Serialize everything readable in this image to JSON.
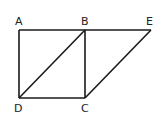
{
  "diagram": {
    "title": "",
    "points": {
      "A": {
        "label": "A",
        "x": 19,
        "y": 30
      },
      "B": {
        "label": "B",
        "x": 85,
        "y": 30
      },
      "E": {
        "label": "E",
        "x": 151,
        "y": 30
      },
      "D": {
        "label": "D",
        "x": 19,
        "y": 98
      },
      "C": {
        "label": "C",
        "x": 85,
        "y": 98
      }
    },
    "segments": [
      [
        "A",
        "B"
      ],
      [
        "B",
        "E"
      ],
      [
        "A",
        "D"
      ],
      [
        "D",
        "C"
      ],
      [
        "B",
        "C"
      ],
      [
        "B",
        "D"
      ],
      [
        "C",
        "E"
      ]
    ],
    "shapes": [
      "square ABCD",
      "parallelogram BECD"
    ],
    "colors": {
      "line": "#1a1a1a",
      "text": "#222222",
      "background": "#ffffff"
    }
  }
}
